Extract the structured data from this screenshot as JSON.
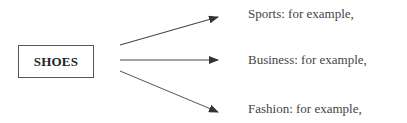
{
  "diagram": {
    "root": {
      "label": "SHOES"
    },
    "branches": [
      {
        "label": "Sports: for example,"
      },
      {
        "label": "Business: for example,"
      },
      {
        "label": "Fashion: for example,"
      }
    ],
    "colors": {
      "line": "#444444",
      "text": "#333333",
      "box_border": "#555555"
    }
  }
}
